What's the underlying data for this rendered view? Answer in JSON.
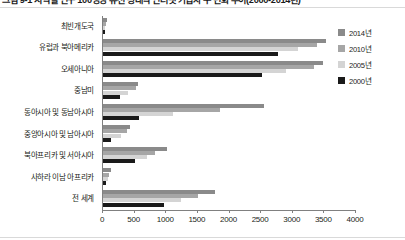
{
  "title": "그림 9-1 지역별 인구 100명당 유선 광대역 인터넷 가입자 수 변화 추이(2000-2014년)",
  "legend": {
    "position": "right",
    "entries": [
      {
        "label": "2014년",
        "color": "#8a8a8a",
        "key": "2014"
      },
      {
        "label": "2010년",
        "color": "#a6a6a6",
        "key": "2010"
      },
      {
        "label": "2005년",
        "color": "#d4d4d4",
        "key": "2005"
      },
      {
        "label": "2000년",
        "color": "#1a1a1a",
        "key": "2000"
      }
    ]
  },
  "axis": {
    "x_ticks": [
      "0",
      "500",
      "1000",
      "1500",
      "2000",
      "2500",
      "3000",
      "3500",
      "4000"
    ],
    "x_min": 0,
    "x_max": 4000,
    "x_label": "",
    "y_label": ""
  },
  "chart_data": {
    "type": "bar",
    "orientation": "horizontal",
    "grouped": true,
    "title": "그림 9-1 지역별 인구 100명당 유선 광대역 인터넷 가입자 수 변화 추이(2000-2014년)",
    "xlabel": "",
    "ylabel": "",
    "xlim": [
      0,
      4000
    ],
    "grid": false,
    "legend_position": "right",
    "categories": [
      "최빈개도국",
      "유럽과 북아메리카",
      "오세아니아",
      "중남미",
      "동아시아 및 동남아시아",
      "중앙아시아 및 남아시아",
      "북아프리카 및 서아시아",
      "사하라 이남 아프리카",
      "전 세계"
    ],
    "series": [
      {
        "name": "2014년",
        "color": "#8a8a8a",
        "values": [
          60,
          3520,
          3480,
          560,
          2540,
          420,
          1010,
          130,
          1770
        ]
      },
      {
        "name": "2010년",
        "color": "#a6a6a6",
        "values": [
          45,
          3390,
          3340,
          520,
          1850,
          380,
          820,
          100,
          1500
        ]
      },
      {
        "name": "2005년",
        "color": "#d4d4d4",
        "values": [
          30,
          3090,
          2900,
          400,
          1100,
          290,
          700,
          80,
          1240
        ]
      },
      {
        "name": "2000년",
        "color": "#1a1a1a",
        "values": [
          20,
          2760,
          2520,
          270,
          570,
          130,
          510,
          55,
          970
        ]
      }
    ]
  }
}
